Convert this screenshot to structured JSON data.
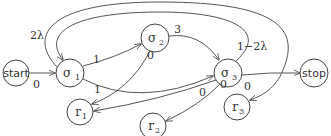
{
  "diagram": {
    "type": "state-transition-graph",
    "nodes": [
      {
        "id": "start",
        "label": "start"
      },
      {
        "id": "s1",
        "label": "σ",
        "sub": "1"
      },
      {
        "id": "s2",
        "label": "σ",
        "sub": "2"
      },
      {
        "id": "s3",
        "label": "σ",
        "sub": "3"
      },
      {
        "id": "stop",
        "label": "stop"
      },
      {
        "id": "r1",
        "label": "r",
        "sub": "1"
      },
      {
        "id": "r2",
        "label": "r",
        "sub": "2"
      },
      {
        "id": "r3",
        "label": "r",
        "sub": "3"
      }
    ],
    "edges": [
      {
        "from": "start",
        "to": "s1",
        "label": "0"
      },
      {
        "from": "s1",
        "to": "s2",
        "label": "1"
      },
      {
        "from": "s1",
        "to": "s3",
        "label": "1"
      },
      {
        "from": "s1",
        "to": "r3",
        "label": "2λ"
      },
      {
        "from": "s2",
        "to": "s3",
        "label": "3"
      },
      {
        "from": "s2",
        "to": "r1",
        "label": "0"
      },
      {
        "from": "s3",
        "to": "s1",
        "label": "1−2λ"
      },
      {
        "from": "s3",
        "to": "stop",
        "label": "0"
      },
      {
        "from": "s3",
        "to": "r1",
        "label": "0"
      },
      {
        "from": "s3",
        "to": "r2",
        "label": "0"
      }
    ]
  }
}
